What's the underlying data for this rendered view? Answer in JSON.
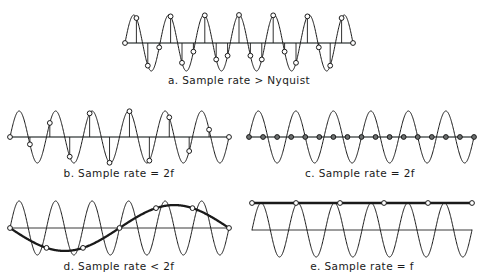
{
  "figure": {
    "background": "#ffffff",
    "ink_color": "#1a1a1a",
    "axis_color": "#555a5a",
    "width": 484,
    "height": 280
  },
  "chart_data": {
    "type": "line",
    "xlabel": "",
    "ylabel": "",
    "grid": false,
    "legend": "none",
    "panels": [
      {
        "id": "a",
        "caption": "a. Sample rate > Nyquist",
        "caption_prefix": "a.",
        "caption_text": "Sample rate > Nyquist",
        "relation": ">",
        "rate_label": "Nyquist",
        "signal": {
          "name": "analog signal",
          "type": "sine",
          "cycles": 6.5,
          "amplitude": 1.0,
          "phase_deg": 0,
          "style": "thin"
        },
        "samples": {
          "name": "sample points",
          "count": 21,
          "per_cycle": 3.23,
          "marker": "open-circle",
          "stems": true,
          "stem_from": "zero-axis"
        },
        "axes": {
          "zero_line": true,
          "zero_line_style": "thick"
        },
        "plot": {
          "x": 125,
          "y": 12,
          "w": 228,
          "h": 56,
          "axis_y": 43,
          "amp_px": 28
        }
      },
      {
        "id": "b",
        "caption": "b. Sample rate = 2f",
        "caption_prefix": "b.",
        "caption_text": "Sample rate = 2f",
        "relation": "=",
        "rate_label": "2f",
        "signal": {
          "name": "analog signal",
          "type": "sine",
          "cycles": 6,
          "amplitude": 1.0,
          "phase_deg": 0,
          "style": "thin"
        },
        "samples": {
          "name": "sample points",
          "count": 12,
          "per_cycle": 2,
          "marker": "open-circle",
          "stems": true,
          "stem_from": "zero-axis",
          "note": "samples land on peaks and troughs"
        },
        "axes": {
          "zero_line": true,
          "zero_line_style": "thick"
        },
        "plot": {
          "x": 10,
          "y": 105,
          "w": 219,
          "h": 55,
          "axis_y": 137,
          "amp_px": 26
        }
      },
      {
        "id": "c",
        "caption": "c. Sample rate = 2f",
        "caption_prefix": "c.",
        "caption_text": "Sample rate = 2f",
        "relation": "=",
        "rate_label": "2f",
        "signal": {
          "name": "analog signal",
          "type": "sine",
          "cycles": 6,
          "amplitude": 1.0,
          "phase_deg": 0,
          "style": "thin"
        },
        "samples": {
          "name": "sample points",
          "count": 17,
          "per_cycle": 2,
          "marker": "filled-circle",
          "stems": false,
          "note": "samples land on zero crossings, reconstructed signal is flat"
        },
        "axes": {
          "zero_line": true,
          "zero_line_style": "thick"
        },
        "plot": {
          "x": 249,
          "y": 105,
          "w": 225,
          "h": 55,
          "axis_y": 137,
          "amp_px": 26
        }
      },
      {
        "id": "d",
        "caption": "d. Sample rate < 2f",
        "caption_prefix": "d.",
        "caption_text": "Sample rate < 2f",
        "relation": "<",
        "rate_label": "2f",
        "signal": {
          "name": "analog signal",
          "type": "sine",
          "cycles": 6,
          "amplitude": 1.0,
          "phase_deg": 0,
          "style": "thin"
        },
        "alias": {
          "name": "aliased reconstruction",
          "type": "sine",
          "cycles": 1,
          "amplitude": 0.85,
          "phase_deg": 180,
          "style": "thick"
        },
        "samples": {
          "name": "sample points",
          "count": 7,
          "per_cycle": 1.17,
          "marker": "open-circle",
          "stems": false,
          "note": "under-sampled, samples trace a lower frequency alias"
        },
        "axes": {
          "zero_line": true,
          "zero_line_style": "thin"
        },
        "plot": {
          "x": 10,
          "y": 195,
          "w": 219,
          "h": 58,
          "axis_y": 228,
          "amp_px": 27
        }
      },
      {
        "id": "e",
        "caption": "e. Sample rate = f",
        "caption_prefix": "e.",
        "caption_text": "Sample rate = f",
        "relation": "=",
        "rate_label": "f",
        "signal": {
          "name": "analog signal",
          "type": "sine",
          "cycles": 6,
          "amplitude": 1.0,
          "phase_deg": 0,
          "style": "thin"
        },
        "alias": {
          "name": "aliased reconstruction",
          "type": "constant",
          "level": 1.0,
          "style": "thick",
          "note": "reconstructed as DC at the peak level"
        },
        "samples": {
          "name": "sample points",
          "count": 6,
          "per_cycle": 1,
          "marker": "open-circle",
          "stems": false,
          "note": "every sample taken at a peak"
        },
        "axes": {
          "zero_line": true,
          "zero_line_style": "thin"
        },
        "plot": {
          "x": 252,
          "y": 195,
          "w": 220,
          "h": 58,
          "axis_y": 230,
          "amp_px": 27
        }
      }
    ]
  },
  "captions": {
    "a": "a. Sample rate > Nyquist",
    "b": "b. Sample rate = 2f",
    "c": "c. Sample rate = 2f",
    "d": "d. Sample rate < 2f",
    "e": "e. Sample rate = f"
  },
  "caption_positions": {
    "a": {
      "x": 239,
      "y": 84
    },
    "b": {
      "x": 119,
      "y": 177
    },
    "c": {
      "x": 360,
      "y": 177
    },
    "d": {
      "x": 119,
      "y": 270
    },
    "e": {
      "x": 362,
      "y": 270
    }
  }
}
